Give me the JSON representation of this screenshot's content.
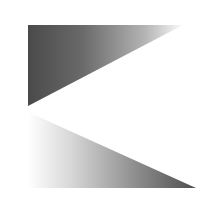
{
  "figure": {
    "background": "#ffffff",
    "shapes": [
      {
        "id": "upper-triangle",
        "points": "28,25 183,25 28,106",
        "gradient": {
          "from": "#4a4a4a",
          "to": "#ffffff",
          "direction": "left-to-right"
        }
      },
      {
        "id": "lower-triangle",
        "points": "28,112 196,188 28,188",
        "gradient": {
          "from": "#ffffff",
          "to": "#4e4e4e",
          "direction": "left-to-right"
        }
      }
    ]
  }
}
